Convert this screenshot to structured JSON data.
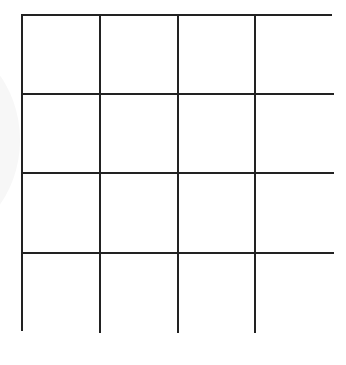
{
  "diagram": {
    "type": "grid",
    "rows": 4,
    "columns": 4,
    "line_color": "#222222",
    "background_color": "#ffffff",
    "cells": [
      [
        "",
        "",
        "",
        ""
      ],
      [
        "",
        "",
        "",
        ""
      ],
      [
        "",
        "",
        "",
        ""
      ],
      [
        "",
        "",
        "",
        ""
      ]
    ]
  }
}
